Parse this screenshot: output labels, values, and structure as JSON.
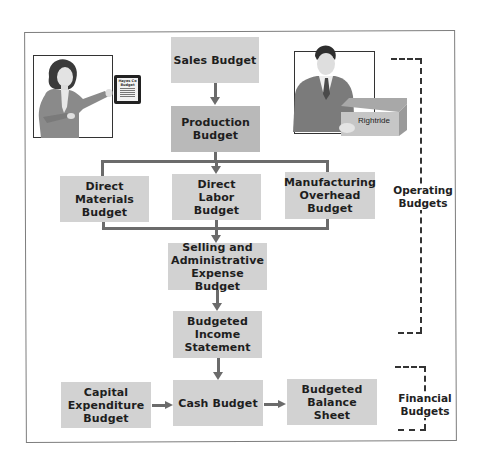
{
  "diagram": {
    "type": "master-budget-flowchart",
    "nodes": {
      "sales": "Sales Budget",
      "production": "Production\nBudget",
      "direct_materials": "Direct\nMaterials\nBudget",
      "direct_labor": "Direct\nLabor\nBudget",
      "manufacturing_overhead": "Manufacturing\nOverhead\nBudget",
      "selling_admin": "Selling and\nAdministrative\nExpense Budget",
      "income_statement": "Budgeted\nIncome\nStatement",
      "capital_expenditure": "Capital\nExpenditure\nBudget",
      "cash": "Cash Budget",
      "balance_sheet": "Budgeted\nBalance\nSheet"
    },
    "groups": {
      "operating": "Operating\nBudgets",
      "financial": "Financial\nBudgets"
    },
    "illustrations": {
      "left": {
        "description": "woman-presenting-tablet",
        "tablet_text": "Hayes Co\nBudget"
      },
      "right": {
        "description": "man-holding-box",
        "box_label": "Rightride"
      }
    },
    "edges": [
      [
        "sales",
        "production"
      ],
      [
        "production",
        "direct_materials"
      ],
      [
        "production",
        "direct_labor"
      ],
      [
        "production",
        "manufacturing_overhead"
      ],
      [
        "direct_materials",
        "selling_admin"
      ],
      [
        "direct_labor",
        "selling_admin"
      ],
      [
        "manufacturing_overhead",
        "selling_admin"
      ],
      [
        "selling_admin",
        "income_statement"
      ],
      [
        "income_statement",
        "cash"
      ],
      [
        "capital_expenditure",
        "cash"
      ],
      [
        "cash",
        "balance_sheet"
      ]
    ],
    "colors": {
      "box_light": "#d2d2d2",
      "box_dark": "#b9b9b9",
      "connector": "#6b6b6b",
      "frame": "#7d7d7d"
    }
  }
}
